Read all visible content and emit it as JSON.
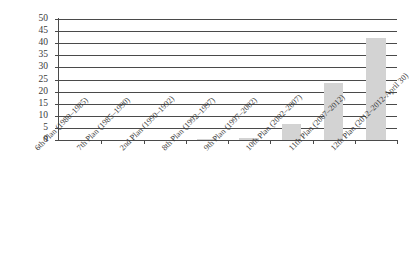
{
  "chart_data": {
    "type": "bar",
    "title": "",
    "subtitle": "",
    "xlabel": "",
    "ylabel": "",
    "legend": [],
    "legend_position": "none",
    "grid": true,
    "grid_axis": "y",
    "ylim": [
      0,
      50
    ],
    "ytick_step": 5,
    "bar_color": "#d3d3d3",
    "gridline_color": "#4a4a4a",
    "axis_color": "#4a4a4a",
    "text_color": "#3a3a3a",
    "background_color": "#ffffff",
    "label_rotation_degrees": -45,
    "categories": [
      "6th Plan (1980–1985)",
      "7th Plan (1985–1990)",
      "2nd Plan (1990–1992)",
      "8th Plan (1992–1997)",
      "9th Plan (1997–2002)",
      "10th Plan (2002–2007)",
      "11th Plan (2007–2012)",
      "12th Plan (2012–2012-April 30)"
    ],
    "values": [
      0,
      0,
      0,
      0.3,
      1,
      6.5,
      23.5,
      42
    ],
    "yticks": [
      0,
      5,
      10,
      15,
      20,
      25,
      30,
      35,
      40,
      45,
      50
    ],
    "ytick_labels": [
      "0",
      "5",
      "10",
      "15",
      "20",
      "25",
      "30",
      "35",
      "40",
      "45",
      "50"
    ]
  }
}
